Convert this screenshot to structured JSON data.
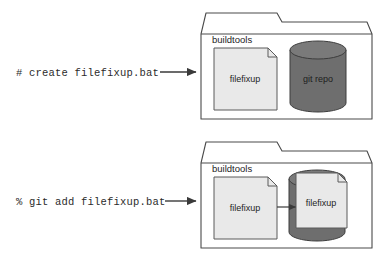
{
  "diagram": {
    "type": "two-panel folder illustration",
    "colors": {
      "folder_fill": "#ffffff",
      "folder_stroke": "#4a4a4a",
      "document_fill": "#e9e9e9",
      "document_stroke": "#5a5a5a",
      "database_fill": "#6e6e6e",
      "database_top_fill": "#7a7a7a",
      "database_stroke": "#3d3d3d",
      "arrow_color": "#3a3a3a",
      "text_color": "#2b2b2b"
    },
    "panels": [
      {
        "id": "panel-create",
        "command": "# create filefixup.bat",
        "arrow": "arrow-right",
        "folder": {
          "title": "buildtools",
          "document": {
            "label": "filefixup",
            "icon": "document-icon"
          },
          "database": {
            "label": "git repo",
            "icon": "database-cylinder-icon"
          },
          "inner_arrow": false
        }
      },
      {
        "id": "panel-add",
        "command": "% git add filefixup.bat",
        "arrow": "arrow-right",
        "folder": {
          "title": "buildtools",
          "document": {
            "label": "filefixup",
            "icon": "document-icon"
          },
          "database": {
            "label": "filefixup",
            "icon": "database-cylinder-icon"
          },
          "inner_arrow": true
        }
      }
    ]
  }
}
